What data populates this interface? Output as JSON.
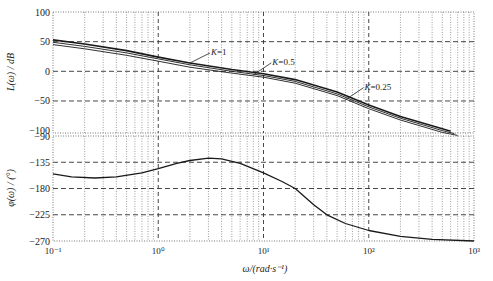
{
  "chart_data": [
    {
      "type": "line",
      "title": "",
      "xlabel": "ω/(rad·s⁻¹)",
      "ylabel": "L(ω) / dB",
      "xscale": "log",
      "xlim": [
        0.1,
        1000
      ],
      "ylim": [
        -110,
        100
      ],
      "yticks": [
        100,
        50,
        0,
        -50,
        -100
      ],
      "grid": true,
      "series": [
        {
          "name": "K=1",
          "x": [
            0.1,
            0.2,
            0.5,
            1,
            2,
            5,
            10,
            20,
            50,
            100,
            200,
            500,
            600
          ],
          "values": [
            53,
            46,
            35,
            24,
            14,
            3,
            -4,
            -14,
            -35,
            -57,
            -76,
            -97,
            -101
          ]
        },
        {
          "name": "K=0.5",
          "x": [
            0.1,
            0.2,
            0.5,
            1,
            2,
            5,
            10,
            20,
            50,
            100,
            200,
            500,
            650
          ],
          "values": [
            49,
            42,
            31,
            21,
            11,
            0,
            -7,
            -17,
            -38,
            -60,
            -79,
            -100,
            -105
          ]
        },
        {
          "name": "K=0.25",
          "x": [
            0.1,
            0.2,
            0.5,
            1,
            2,
            5,
            10,
            20,
            50,
            100,
            200,
            500,
            700
          ],
          "values": [
            45,
            38,
            27,
            17,
            7,
            -3,
            -10,
            -20,
            -41,
            -63,
            -82,
            -103,
            -108
          ]
        }
      ],
      "annotations": [
        {
          "text": "K=1",
          "x": 2.0,
          "y": 14
        },
        {
          "text": "K=0.5",
          "x": 8.0,
          "y": -6
        },
        {
          "text": "K=0.25",
          "x": 60,
          "y": -48
        }
      ]
    },
    {
      "type": "line",
      "title": "",
      "xlabel": "ω/(rad·s⁻¹)",
      "ylabel": "φ(ω) / (°)",
      "xscale": "log",
      "xlim": [
        0.1,
        1000
      ],
      "ylim": [
        -270,
        -90
      ],
      "yticks": [
        -90,
        -135,
        -180,
        -225,
        -270
      ],
      "xticks": [
        "10⁻¹",
        "10⁰",
        "10¹",
        "10²",
        "10³"
      ],
      "grid": true,
      "series": [
        {
          "name": "phase",
          "x": [
            0.1,
            0.15,
            0.25,
            0.4,
            0.7,
            1,
            1.5,
            2,
            3,
            4,
            6,
            10,
            15,
            20,
            30,
            40,
            60,
            100,
            200,
            400,
            1000
          ],
          "values": [
            -155,
            -160,
            -162,
            -160,
            -153,
            -146,
            -137,
            -132,
            -128,
            -129,
            -137,
            -153,
            -168,
            -180,
            -208,
            -225,
            -240,
            -252,
            -262,
            -267,
            -270
          ]
        }
      ]
    }
  ],
  "labels": {
    "top_ylabel": "L(ω) / dB",
    "bottom_ylabel": "φ(ω) / (°)",
    "xlabel": "ω/(rad·s⁻¹)",
    "top_yticks": [
      "100",
      "50",
      "0",
      "−50",
      "−100"
    ],
    "bottom_yticks": [
      "−90",
      "−135",
      "−180",
      "−225",
      "−270"
    ],
    "xticks": [
      "10⁻¹",
      "10⁰",
      "10¹",
      "10²",
      "10³"
    ]
  }
}
